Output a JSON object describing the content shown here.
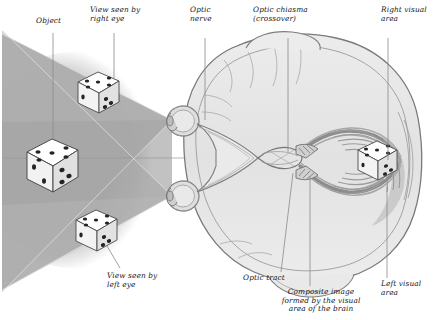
{
  "figure": {
    "view": "transverse section through head seen from above",
    "frame_color": "#6f6f6f",
    "background_color": "#ffffff"
  },
  "labels": {
    "object": "Object",
    "view_right_eye": "View seen by\nright eye",
    "optic_nerve": "Optic\nnerve",
    "optic_chiasma": "Optic chiasma\n(crossover)",
    "right_visual_area": "Right visual\narea",
    "view_left_eye": "View seen by\nleft eye",
    "optic_tract": "Optic tract",
    "composite_image": "Composite image\nformed by the visual\narea of the brain",
    "left_visual_area": "Left visual\narea"
  },
  "diagram": {
    "field_cone_light": "#c9c9c9",
    "field_cone_mid": "#b0b0b0",
    "field_cone_dark": "#8e8e8e",
    "blur_halo": "#d8d8d8",
    "brain_fill": "#e6e6e6",
    "brain_outline": "#7d7d7d",
    "tract_fill": "#9a9a9a",
    "leader_line_color": "#8a8a8a",
    "die_face": "#ffffff",
    "die_shade": "#d2d2d2",
    "pip_color": "#2b2b2b",
    "dice": [
      {
        "name": "object-die",
        "role": "the real object viewed",
        "top_pips": 5,
        "left_pips": 2,
        "right_pips": 3
      },
      {
        "name": "right-eye-die",
        "role": "image seen by right eye",
        "top_pips": 5,
        "left_pips": 1,
        "right_pips": 3
      },
      {
        "name": "left-eye-die",
        "role": "image seen by left eye",
        "top_pips": 5,
        "left_pips": 1,
        "right_pips": 3
      },
      {
        "name": "composite-die",
        "role": "composite image in visual cortex",
        "top_pips": 5,
        "left_pips": 1,
        "right_pips": 3
      }
    ],
    "structures": [
      "right eye",
      "left eye",
      "right optic nerve",
      "left optic nerve",
      "optic chiasma",
      "right optic tract",
      "left optic tract",
      "right visual area",
      "left visual area",
      "cerebral hemispheres",
      "cerebellum"
    ]
  }
}
